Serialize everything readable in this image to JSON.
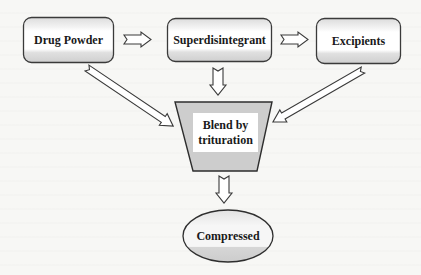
{
  "diagram": {
    "type": "flowchart",
    "nodes": [
      {
        "id": "drug_powder",
        "label": "Drug Powder",
        "shape": "rounded-rect"
      },
      {
        "id": "superdisintegrant",
        "label": "Superdisintegrant",
        "shape": "rounded-rect"
      },
      {
        "id": "excipients",
        "label": "Excipients",
        "shape": "rounded-rect"
      },
      {
        "id": "blend",
        "label": "Blend by trituration",
        "label_line1": "Blend by",
        "label_line2": "trituration",
        "shape": "trapezoid"
      },
      {
        "id": "compressed",
        "label": "Compressed",
        "shape": "ellipse"
      }
    ],
    "edges": [
      {
        "from": "drug_powder",
        "to": "superdisintegrant",
        "style": "block-arrow"
      },
      {
        "from": "superdisintegrant",
        "to": "excipients",
        "style": "block-arrow"
      },
      {
        "from": "drug_powder",
        "to": "blend",
        "style": "block-arrow"
      },
      {
        "from": "superdisintegrant",
        "to": "blend",
        "style": "block-arrow"
      },
      {
        "from": "excipients",
        "to": "blend",
        "style": "block-arrow"
      },
      {
        "from": "blend",
        "to": "compressed",
        "style": "block-arrow"
      }
    ],
    "colors": {
      "stroke": "#3a3a3a",
      "fill_gray": "#cfcfcf",
      "fill_light": "#e6e6e6",
      "fill_white": "#ffffff",
      "background": "#f7f7f5"
    }
  }
}
